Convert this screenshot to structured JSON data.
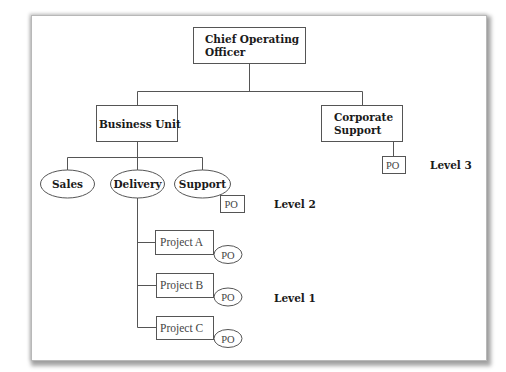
{
  "diagram": {
    "nodes": {
      "coo": {
        "line1": "Chief Operating",
        "line2": "Officer"
      },
      "business_unit": {
        "label": "Business Unit"
      },
      "corporate_support": {
        "line1": "Corporate",
        "line2": "Support"
      },
      "sales": {
        "label": "Sales"
      },
      "delivery": {
        "label": "Delivery"
      },
      "support": {
        "label": "Support"
      },
      "project_a": {
        "label": "Project A"
      },
      "project_b": {
        "label": "Project B"
      },
      "project_c": {
        "label": "Project C"
      }
    },
    "po": {
      "corporate_support": "PO",
      "support": "PO",
      "project_a": "PO",
      "project_b": "PO",
      "project_c": "PO"
    },
    "levels": {
      "level3": "Level 3",
      "level2": "Level 2",
      "level1": "Level 1"
    }
  }
}
